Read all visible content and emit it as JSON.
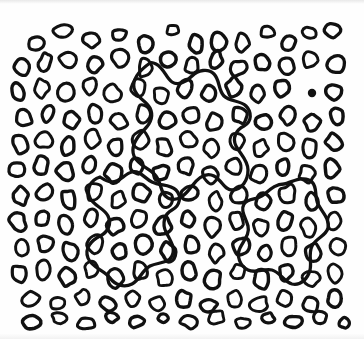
{
  "figure": {
    "width": 364,
    "height": 339,
    "background_color": "#fefefe",
    "ink_color": "#111111"
  },
  "chart_data": {
    "type": "scatter",
    "title": "",
    "xlabel": "",
    "ylabel": "",
    "xlim": [
      0,
      364
    ],
    "ylim": [
      0,
      339
    ],
    "grid": false,
    "legend": "none",
    "marker_style": {
      "shape": "oval-outline",
      "fill": "none",
      "stroke": "#111111",
      "stroke_width_px": 3.2,
      "mean_width_px": 15,
      "mean_height_px": 18
    },
    "counts": {
      "blobs": 268,
      "filled_dots": 1,
      "meandering_curves": 3
    },
    "filled_dots": [
      {
        "cx": 312,
        "cy": 93,
        "r": 4.2,
        "color": "#111111"
      }
    ],
    "blobs": [
      {
        "cx": 36,
        "cy": 44,
        "rx": 8,
        "ry": 7,
        "rot": -18
      },
      {
        "cx": 63,
        "cy": 31,
        "rx": 10,
        "ry": 6,
        "rot": -8
      },
      {
        "cx": 92,
        "cy": 40,
        "rx": 8,
        "ry": 8,
        "rot": 12
      },
      {
        "cx": 119,
        "cy": 35,
        "rx": 7,
        "ry": 6,
        "rot": -25
      },
      {
        "cx": 146,
        "cy": 44,
        "rx": 7,
        "ry": 8,
        "rot": 5
      },
      {
        "cx": 173,
        "cy": 30,
        "rx": 6,
        "ry": 5,
        "rot": -12
      },
      {
        "cx": 196,
        "cy": 44,
        "rx": 7,
        "ry": 9,
        "rot": 8
      },
      {
        "cx": 219,
        "cy": 42,
        "rx": 7,
        "ry": 9,
        "rot": -6
      },
      {
        "cx": 242,
        "cy": 43,
        "rx": 7,
        "ry": 9,
        "rot": 10
      },
      {
        "cx": 268,
        "cy": 32,
        "rx": 7,
        "ry": 6,
        "rot": -14
      },
      {
        "cx": 289,
        "cy": 43,
        "rx": 7,
        "ry": 7,
        "rot": 16
      },
      {
        "cx": 310,
        "cy": 33,
        "rx": 7,
        "ry": 6,
        "rot": -4
      },
      {
        "cx": 333,
        "cy": 30,
        "rx": 8,
        "ry": 7,
        "rot": 9
      },
      {
        "cx": 22,
        "cy": 68,
        "rx": 7,
        "ry": 9,
        "rot": -22
      },
      {
        "cx": 45,
        "cy": 62,
        "rx": 6,
        "ry": 9,
        "rot": 14
      },
      {
        "cx": 68,
        "cy": 59,
        "rx": 9,
        "ry": 8,
        "rot": -10
      },
      {
        "cx": 95,
        "cy": 64,
        "rx": 7,
        "ry": 8,
        "rot": 6
      },
      {
        "cx": 120,
        "cy": 58,
        "rx": 8,
        "ry": 8,
        "rot": -18
      },
      {
        "cx": 145,
        "cy": 68,
        "rx": 7,
        "ry": 9,
        "rot": 4
      },
      {
        "cx": 168,
        "cy": 60,
        "rx": 8,
        "ry": 8,
        "rot": 20
      },
      {
        "cx": 192,
        "cy": 66,
        "rx": 7,
        "ry": 8,
        "rot": -9
      },
      {
        "cx": 216,
        "cy": 60,
        "rx": 6,
        "ry": 9,
        "rot": 12
      },
      {
        "cx": 238,
        "cy": 68,
        "rx": 8,
        "ry": 8,
        "rot": -5
      },
      {
        "cx": 262,
        "cy": 62,
        "rx": 7,
        "ry": 9,
        "rot": 8
      },
      {
        "cx": 286,
        "cy": 66,
        "rx": 8,
        "ry": 8,
        "rot": -15
      },
      {
        "cx": 310,
        "cy": 60,
        "rx": 7,
        "ry": 8,
        "rot": 3
      },
      {
        "cx": 336,
        "cy": 64,
        "rx": 8,
        "ry": 9,
        "rot": 11
      },
      {
        "cx": 18,
        "cy": 92,
        "rx": 7,
        "ry": 9,
        "rot": -20
      },
      {
        "cx": 42,
        "cy": 88,
        "rx": 7,
        "ry": 9,
        "rot": 7
      },
      {
        "cx": 66,
        "cy": 92,
        "rx": 8,
        "ry": 8,
        "rot": -12
      },
      {
        "cx": 90,
        "cy": 86,
        "rx": 7,
        "ry": 8,
        "rot": 15
      },
      {
        "cx": 113,
        "cy": 94,
        "rx": 8,
        "ry": 9,
        "rot": -6
      },
      {
        "cx": 138,
        "cy": 88,
        "rx": 7,
        "ry": 9,
        "rot": 9
      },
      {
        "cx": 161,
        "cy": 95,
        "rx": 8,
        "ry": 8,
        "rot": -18
      },
      {
        "cx": 185,
        "cy": 88,
        "rx": 7,
        "ry": 9,
        "rot": 5
      },
      {
        "cx": 209,
        "cy": 94,
        "rx": 7,
        "ry": 8,
        "rot": 13
      },
      {
        "cx": 234,
        "cy": 87,
        "rx": 8,
        "ry": 9,
        "rot": -8
      },
      {
        "cx": 258,
        "cy": 94,
        "rx": 7,
        "ry": 8,
        "rot": 6
      },
      {
        "cx": 282,
        "cy": 88,
        "rx": 8,
        "ry": 9,
        "rot": -16
      },
      {
        "cx": 334,
        "cy": 92,
        "rx": 8,
        "ry": 8,
        "rot": 10
      },
      {
        "cx": 24,
        "cy": 118,
        "rx": 8,
        "ry": 8,
        "rot": -10
      },
      {
        "cx": 48,
        "cy": 113,
        "rx": 6,
        "ry": 9,
        "rot": 18
      },
      {
        "cx": 71,
        "cy": 120,
        "rx": 8,
        "ry": 8,
        "rot": -5
      },
      {
        "cx": 95,
        "cy": 114,
        "rx": 7,
        "ry": 9,
        "rot": 8
      },
      {
        "cx": 119,
        "cy": 121,
        "rx": 8,
        "ry": 8,
        "rot": -20
      },
      {
        "cx": 143,
        "cy": 114,
        "rx": 7,
        "ry": 9,
        "rot": 4
      },
      {
        "cx": 167,
        "cy": 121,
        "rx": 8,
        "ry": 9,
        "rot": 12
      },
      {
        "cx": 191,
        "cy": 115,
        "rx": 7,
        "ry": 8,
        "rot": -7
      },
      {
        "cx": 215,
        "cy": 122,
        "rx": 8,
        "ry": 9,
        "rot": 9
      },
      {
        "cx": 240,
        "cy": 115,
        "rx": 7,
        "ry": 9,
        "rot": -14
      },
      {
        "cx": 264,
        "cy": 122,
        "rx": 8,
        "ry": 8,
        "rot": 6
      },
      {
        "cx": 288,
        "cy": 115,
        "rx": 7,
        "ry": 9,
        "rot": 16
      },
      {
        "cx": 312,
        "cy": 122,
        "rx": 8,
        "ry": 8,
        "rot": -9
      },
      {
        "cx": 337,
        "cy": 116,
        "rx": 7,
        "ry": 9,
        "rot": 5
      },
      {
        "cx": 20,
        "cy": 144,
        "rx": 7,
        "ry": 9,
        "rot": -16
      },
      {
        "cx": 44,
        "cy": 140,
        "rx": 8,
        "ry": 8,
        "rot": 10
      },
      {
        "cx": 68,
        "cy": 146,
        "rx": 7,
        "ry": 9,
        "rot": -4
      },
      {
        "cx": 92,
        "cy": 139,
        "rx": 8,
        "ry": 9,
        "rot": 14
      },
      {
        "cx": 116,
        "cy": 147,
        "rx": 7,
        "ry": 8,
        "rot": -11
      },
      {
        "cx": 140,
        "cy": 140,
        "rx": 8,
        "ry": 9,
        "rot": 7
      },
      {
        "cx": 164,
        "cy": 147,
        "rx": 7,
        "ry": 9,
        "rot": -19
      },
      {
        "cx": 188,
        "cy": 140,
        "rx": 8,
        "ry": 8,
        "rot": 3
      },
      {
        "cx": 212,
        "cy": 148,
        "rx": 7,
        "ry": 9,
        "rot": 12
      },
      {
        "cx": 237,
        "cy": 141,
        "rx": 8,
        "ry": 9,
        "rot": -6
      },
      {
        "cx": 261,
        "cy": 148,
        "rx": 7,
        "ry": 8,
        "rot": 9
      },
      {
        "cx": 285,
        "cy": 141,
        "rx": 8,
        "ry": 9,
        "rot": -13
      },
      {
        "cx": 309,
        "cy": 148,
        "rx": 7,
        "ry": 9,
        "rot": 5
      },
      {
        "cx": 334,
        "cy": 142,
        "rx": 8,
        "ry": 8,
        "rot": 17
      },
      {
        "cx": 17,
        "cy": 170,
        "rx": 8,
        "ry": 8,
        "rot": -8
      },
      {
        "cx": 41,
        "cy": 166,
        "rx": 7,
        "ry": 9,
        "rot": 11
      },
      {
        "cx": 65,
        "cy": 172,
        "rx": 8,
        "ry": 9,
        "rot": -17
      },
      {
        "cx": 89,
        "cy": 165,
        "rx": 7,
        "ry": 8,
        "rot": 6
      },
      {
        "cx": 113,
        "cy": 173,
        "rx": 8,
        "ry": 9,
        "rot": 13
      },
      {
        "cx": 137,
        "cy": 166,
        "rx": 7,
        "ry": 9,
        "rot": -5
      },
      {
        "cx": 161,
        "cy": 173,
        "rx": 8,
        "ry": 8,
        "rot": 8
      },
      {
        "cx": 186,
        "cy": 166,
        "rx": 7,
        "ry": 9,
        "rot": -15
      },
      {
        "cx": 210,
        "cy": 174,
        "rx": 8,
        "ry": 9,
        "rot": 4
      },
      {
        "cx": 234,
        "cy": 167,
        "rx": 7,
        "ry": 8,
        "rot": 10
      },
      {
        "cx": 258,
        "cy": 174,
        "rx": 8,
        "ry": 9,
        "rot": -7
      },
      {
        "cx": 283,
        "cy": 167,
        "rx": 7,
        "ry": 9,
        "rot": 15
      },
      {
        "cx": 307,
        "cy": 174,
        "rx": 8,
        "ry": 8,
        "rot": -3
      },
      {
        "cx": 332,
        "cy": 168,
        "rx": 7,
        "ry": 9,
        "rot": 9
      },
      {
        "cx": 21,
        "cy": 196,
        "rx": 7,
        "ry": 9,
        "rot": -12
      },
      {
        "cx": 45,
        "cy": 192,
        "rx": 8,
        "ry": 8,
        "rot": 7
      },
      {
        "cx": 69,
        "cy": 199,
        "rx": 7,
        "ry": 9,
        "rot": -20
      },
      {
        "cx": 94,
        "cy": 192,
        "rx": 8,
        "ry": 9,
        "rot": 5
      },
      {
        "cx": 118,
        "cy": 200,
        "rx": 7,
        "ry": 8,
        "rot": 14
      },
      {
        "cx": 142,
        "cy": 193,
        "rx": 8,
        "ry": 9,
        "rot": -9
      },
      {
        "cx": 166,
        "cy": 200,
        "rx": 7,
        "ry": 9,
        "rot": 6
      },
      {
        "cx": 190,
        "cy": 193,
        "rx": 8,
        "ry": 8,
        "rot": -16
      },
      {
        "cx": 215,
        "cy": 201,
        "rx": 7,
        "ry": 9,
        "rot": 3
      },
      {
        "cx": 239,
        "cy": 194,
        "rx": 8,
        "ry": 9,
        "rot": 11
      },
      {
        "cx": 263,
        "cy": 201,
        "rx": 7,
        "ry": 8,
        "rot": -6
      },
      {
        "cx": 288,
        "cy": 194,
        "rx": 8,
        "ry": 9,
        "rot": 9
      },
      {
        "cx": 312,
        "cy": 201,
        "rx": 7,
        "ry": 9,
        "rot": -14
      },
      {
        "cx": 336,
        "cy": 195,
        "rx": 8,
        "ry": 8,
        "rot": 4
      },
      {
        "cx": 18,
        "cy": 222,
        "rx": 8,
        "ry": 9,
        "rot": -10
      },
      {
        "cx": 42,
        "cy": 218,
        "rx": 7,
        "ry": 8,
        "rot": 12
      },
      {
        "cx": 66,
        "cy": 225,
        "rx": 8,
        "ry": 9,
        "rot": -5
      },
      {
        "cx": 91,
        "cy": 218,
        "rx": 7,
        "ry": 9,
        "rot": 8
      },
      {
        "cx": 115,
        "cy": 226,
        "rx": 8,
        "ry": 8,
        "rot": -18
      },
      {
        "cx": 139,
        "cy": 219,
        "rx": 7,
        "ry": 9,
        "rot": 5
      },
      {
        "cx": 163,
        "cy": 226,
        "rx": 8,
        "ry": 9,
        "rot": 13
      },
      {
        "cx": 188,
        "cy": 219,
        "rx": 7,
        "ry": 8,
        "rot": -7
      },
      {
        "cx": 212,
        "cy": 227,
        "rx": 8,
        "ry": 9,
        "rot": 10
      },
      {
        "cx": 236,
        "cy": 220,
        "rx": 7,
        "ry": 9,
        "rot": -15
      },
      {
        "cx": 261,
        "cy": 227,
        "rx": 8,
        "ry": 8,
        "rot": 6
      },
      {
        "cx": 285,
        "cy": 220,
        "rx": 7,
        "ry": 9,
        "rot": 16
      },
      {
        "cx": 309,
        "cy": 227,
        "rx": 8,
        "ry": 9,
        "rot": -8
      },
      {
        "cx": 334,
        "cy": 221,
        "rx": 7,
        "ry": 8,
        "rot": 4
      },
      {
        "cx": 22,
        "cy": 248,
        "rx": 7,
        "ry": 9,
        "rot": -14
      },
      {
        "cx": 46,
        "cy": 244,
        "rx": 8,
        "ry": 8,
        "rot": 9
      },
      {
        "cx": 70,
        "cy": 251,
        "rx": 7,
        "ry": 9,
        "rot": -6
      },
      {
        "cx": 95,
        "cy": 244,
        "rx": 8,
        "ry": 9,
        "rot": 13
      },
      {
        "cx": 119,
        "cy": 252,
        "rx": 7,
        "ry": 8,
        "rot": -11
      },
      {
        "cx": 143,
        "cy": 245,
        "rx": 8,
        "ry": 9,
        "rot": 7
      },
      {
        "cx": 168,
        "cy": 252,
        "rx": 7,
        "ry": 9,
        "rot": -19
      },
      {
        "cx": 192,
        "cy": 245,
        "rx": 8,
        "ry": 8,
        "rot": 3
      },
      {
        "cx": 216,
        "cy": 253,
        "rx": 7,
        "ry": 9,
        "rot": 12
      },
      {
        "cx": 241,
        "cy": 246,
        "rx": 8,
        "ry": 9,
        "rot": -5
      },
      {
        "cx": 265,
        "cy": 253,
        "rx": 7,
        "ry": 8,
        "rot": 10
      },
      {
        "cx": 289,
        "cy": 246,
        "rx": 8,
        "ry": 9,
        "rot": -13
      },
      {
        "cx": 313,
        "cy": 253,
        "rx": 7,
        "ry": 9,
        "rot": 6
      },
      {
        "cx": 338,
        "cy": 247,
        "rx": 8,
        "ry": 8,
        "rot": 15
      },
      {
        "cx": 19,
        "cy": 274,
        "rx": 8,
        "ry": 8,
        "rot": -9
      },
      {
        "cx": 43,
        "cy": 270,
        "rx": 7,
        "ry": 9,
        "rot": 11
      },
      {
        "cx": 67,
        "cy": 277,
        "rx": 8,
        "ry": 9,
        "rot": -16
      },
      {
        "cx": 92,
        "cy": 270,
        "rx": 7,
        "ry": 8,
        "rot": 5
      },
      {
        "cx": 116,
        "cy": 278,
        "rx": 8,
        "ry": 9,
        "rot": 12
      },
      {
        "cx": 140,
        "cy": 271,
        "rx": 7,
        "ry": 9,
        "rot": -4
      },
      {
        "cx": 165,
        "cy": 278,
        "rx": 8,
        "ry": 8,
        "rot": 8
      },
      {
        "cx": 189,
        "cy": 271,
        "rx": 7,
        "ry": 9,
        "rot": -17
      },
      {
        "cx": 213,
        "cy": 279,
        "rx": 8,
        "ry": 9,
        "rot": 4
      },
      {
        "cx": 238,
        "cy": 272,
        "rx": 7,
        "ry": 8,
        "rot": 10
      },
      {
        "cx": 262,
        "cy": 279,
        "rx": 8,
        "ry": 9,
        "rot": -7
      },
      {
        "cx": 286,
        "cy": 272,
        "rx": 7,
        "ry": 9,
        "rot": 14
      },
      {
        "cx": 311,
        "cy": 279,
        "rx": 8,
        "ry": 8,
        "rot": -3
      },
      {
        "cx": 335,
        "cy": 273,
        "rx": 7,
        "ry": 9,
        "rot": 9
      },
      {
        "cx": 30,
        "cy": 299,
        "rx": 9,
        "ry": 7,
        "rot": -12
      },
      {
        "cx": 57,
        "cy": 303,
        "rx": 8,
        "ry": 6,
        "rot": 8
      },
      {
        "cx": 83,
        "cy": 298,
        "rx": 7,
        "ry": 8,
        "rot": -6
      },
      {
        "cx": 108,
        "cy": 304,
        "rx": 9,
        "ry": 6,
        "rot": 14
      },
      {
        "cx": 133,
        "cy": 298,
        "rx": 7,
        "ry": 8,
        "rot": -10
      },
      {
        "cx": 158,
        "cy": 304,
        "rx": 8,
        "ry": 7,
        "rot": 5
      },
      {
        "cx": 184,
        "cy": 299,
        "rx": 7,
        "ry": 8,
        "rot": 12
      },
      {
        "cx": 209,
        "cy": 305,
        "rx": 8,
        "ry": 6,
        "rot": -8
      },
      {
        "cx": 234,
        "cy": 299,
        "rx": 7,
        "ry": 9,
        "rot": 7
      },
      {
        "cx": 259,
        "cy": 304,
        "rx": 9,
        "ry": 7,
        "rot": -14
      },
      {
        "cx": 285,
        "cy": 299,
        "rx": 7,
        "ry": 8,
        "rot": 6
      },
      {
        "cx": 310,
        "cy": 305,
        "rx": 8,
        "ry": 7,
        "rot": 11
      },
      {
        "cx": 334,
        "cy": 299,
        "rx": 7,
        "ry": 8,
        "rot": -5
      },
      {
        "cx": 32,
        "cy": 322,
        "rx": 9,
        "ry": 6,
        "rot": -7
      },
      {
        "cx": 60,
        "cy": 318,
        "rx": 8,
        "ry": 5,
        "rot": 10
      },
      {
        "cx": 86,
        "cy": 323,
        "rx": 9,
        "ry": 6,
        "rot": -4
      },
      {
        "cx": 112,
        "cy": 317,
        "rx": 6,
        "ry": 5,
        "rot": 8
      },
      {
        "cx": 137,
        "cy": 322,
        "rx": 8,
        "ry": 5,
        "rot": -12
      },
      {
        "cx": 163,
        "cy": 318,
        "rx": 5,
        "ry": 4,
        "rot": 6
      },
      {
        "cx": 190,
        "cy": 322,
        "rx": 9,
        "ry": 6,
        "rot": 9
      },
      {
        "cx": 216,
        "cy": 317,
        "rx": 8,
        "ry": 7,
        "rot": -9
      },
      {
        "cx": 243,
        "cy": 323,
        "rx": 7,
        "ry": 5,
        "rot": 5
      },
      {
        "cx": 268,
        "cy": 318,
        "rx": 6,
        "ry": 5,
        "rot": 13
      },
      {
        "cx": 294,
        "cy": 322,
        "rx": 9,
        "ry": 6,
        "rot": -6
      },
      {
        "cx": 320,
        "cy": 318,
        "rx": 7,
        "ry": 6,
        "rot": 8
      },
      {
        "cx": 344,
        "cy": 323,
        "rx": 6,
        "ry": 5,
        "rot": -10
      }
    ],
    "curves": [
      {
        "id": "curve-upper",
        "closed": true,
        "bbox": [
          128,
          62,
          252,
          200
        ],
        "description": "long meandering closed contour through the upper-middle of the field"
      },
      {
        "id": "curve-left",
        "closed": true,
        "bbox": [
          40,
          175,
          180,
          290
        ],
        "description": "wavy closed contour in the lower-left quadrant"
      },
      {
        "id": "curve-lower-right",
        "closed": true,
        "bbox": [
          240,
          180,
          330,
          290
        ],
        "description": "large amoeba-shaped closed contour in the lower-right quadrant"
      }
    ]
  }
}
